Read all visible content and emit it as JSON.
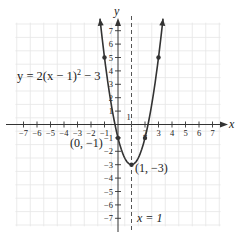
{
  "chart_data": {
    "type": "line",
    "title": "",
    "function": "y = 2(x - 1)^2 - 3",
    "xlabel": "x",
    "ylabel": "y",
    "xlim": [
      -7,
      7
    ],
    "ylim": [
      -7,
      7
    ],
    "grid": true,
    "x_ticks": [
      -7,
      -6,
      -5,
      -4,
      -3,
      -2,
      -1,
      1,
      2,
      3,
      4,
      5,
      6,
      7
    ],
    "y_ticks": [
      -7,
      -6,
      -5,
      -4,
      -3,
      -2,
      -1,
      1,
      2,
      3,
      4,
      5,
      6,
      7
    ],
    "x_tick_labels": [
      "−7",
      "−6",
      "−5",
      "−4",
      "−3",
      "−2",
      "−1",
      "1",
      "2",
      "3",
      "4",
      "5",
      "6",
      "7"
    ],
    "y_tick_labels": [
      "−7",
      "−6",
      "−5",
      "−4",
      "−3",
      "−2",
      "−1",
      "1",
      "2",
      "3",
      "4",
      "5",
      "6",
      "7"
    ],
    "series": [
      {
        "name": "y = 2(x − 1)² − 3",
        "marked_points": [
          {
            "x": -1,
            "y": 5
          },
          {
            "x": 0,
            "y": -1
          },
          {
            "x": 1,
            "y": -3
          },
          {
            "x": 2,
            "y": -1
          },
          {
            "x": 3,
            "y": 5
          }
        ]
      }
    ],
    "axis_of_symmetry": {
      "x": 1,
      "style": "dashed",
      "label": "x = 1"
    },
    "annotations": [
      {
        "text": "y = 2(x − 1)² − 3",
        "kind": "equation-label"
      },
      {
        "text": "(0, −1)",
        "at": {
          "x": 0,
          "y": -1
        }
      },
      {
        "text": "(1, −3)",
        "at": {
          "x": 1,
          "y": -3
        },
        "kind": "vertex"
      },
      {
        "text": "x = 1",
        "kind": "axis-of-symmetry-label"
      }
    ],
    "colors": {
      "curve": "#333333",
      "axes": "#333333",
      "grid": "#e6e6e6",
      "dashed_line": "#555555"
    }
  },
  "labels": {
    "x_axis": "x",
    "y_axis": "y",
    "equation_prefix": "y = 2(x − 1)",
    "equation_exp": "2",
    "equation_suffix": " − 3",
    "point_0_neg1": "(0, −1)",
    "vertex": "(1, −3)",
    "symmetry": "x = 1"
  }
}
